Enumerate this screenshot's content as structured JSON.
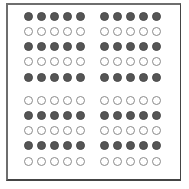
{
  "figure": {
    "colors": {
      "filled": "#555555",
      "empty_stroke": "#8a8a8a",
      "frame": "#555555",
      "background": "#ffffff"
    },
    "panels": [
      {
        "name": "top-left",
        "origin": [
          28,
          16
        ],
        "rows": [
          "filled",
          "empty",
          "filled",
          "empty",
          "filled"
        ]
      },
      {
        "name": "top-right",
        "origin": [
          104,
          16
        ],
        "rows": [
          "filled",
          "empty",
          "filled",
          "empty",
          "filled"
        ]
      },
      {
        "name": "bottom-left",
        "origin": [
          28,
          100
        ],
        "rows": [
          "empty",
          "filled",
          "empty",
          "filled",
          "empty"
        ]
      },
      {
        "name": "bottom-right",
        "origin": [
          104,
          100
        ],
        "rows": [
          "empty",
          "filled",
          "empty",
          "filled",
          "empty"
        ]
      }
    ],
    "columns_per_row": 5,
    "col_spacing": 13,
    "row_spacing": 15.3
  }
}
